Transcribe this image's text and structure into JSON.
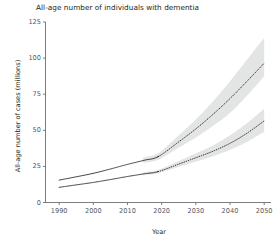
{
  "chart_data": {
    "type": "line",
    "title": "All-age number of individuals with dementia",
    "xlabel": "Year",
    "ylabel": "All-age number of cases (millions)",
    "xlim": [
      1986,
      2052
    ],
    "ylim": [
      0,
      125
    ],
    "xticks": [
      1990,
      2000,
      2010,
      2020,
      2030,
      2040,
      2050
    ],
    "yticks": [
      0,
      25,
      50,
      75,
      100,
      125
    ],
    "grid": false,
    "legend": null,
    "observed_until": 2019,
    "x": [
      1990,
      1995,
      2000,
      2005,
      2010,
      2015,
      2019,
      2025,
      2030,
      2035,
      2040,
      2045,
      2050
    ],
    "series": [
      {
        "name": "upper-projection",
        "style": "solid-then-dotted",
        "values": [
          15.5,
          17.8,
          20.2,
          23.2,
          26.4,
          29.3,
          31.8,
          42.0,
          51.0,
          61.0,
          72.0,
          84.0,
          96.5
        ],
        "ui_upper": [
          16.4,
          18.9,
          21.5,
          24.7,
          28.1,
          31.3,
          34.2,
          46.5,
          57.5,
          70.0,
          84.0,
          99.0,
          114.0
        ],
        "ui_lower": [
          14.6,
          16.7,
          19.0,
          21.8,
          24.8,
          27.5,
          29.6,
          38.0,
          45.0,
          53.0,
          62.0,
          74.0,
          87.5
        ]
      },
      {
        "name": "lower-projection",
        "style": "solid-then-dotted",
        "values": [
          10.5,
          12.2,
          13.9,
          15.9,
          18.0,
          19.9,
          21.4,
          26.6,
          31.0,
          35.5,
          41.0,
          48.0,
          56.5
        ],
        "ui_upper": [
          10.9,
          12.7,
          14.5,
          16.6,
          18.9,
          20.9,
          22.6,
          28.7,
          34.0,
          39.5,
          46.5,
          55.0,
          65.0
        ],
        "ui_lower": [
          10.1,
          11.7,
          13.3,
          15.2,
          17.2,
          19.0,
          20.3,
          24.7,
          28.3,
          32.0,
          36.5,
          42.0,
          49.0
        ]
      }
    ],
    "colors": {
      "line": "#231f20",
      "band": "#d8d9da",
      "axis": "#6d6e71",
      "text": "#231f20",
      "tick_text": "#58595b"
    }
  }
}
